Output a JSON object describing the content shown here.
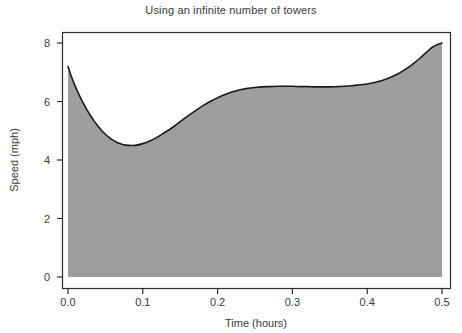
{
  "chart_data": {
    "type": "area",
    "title": "Using an infinite number of towers",
    "xlabel": "Time (hours)",
    "ylabel": "Speed (mph)",
    "xlim": [
      0.0,
      0.5
    ],
    "ylim": [
      0.0,
      8.6
    ],
    "xticks": [
      0.0,
      0.1,
      0.2,
      0.3,
      0.4,
      0.5
    ],
    "xtick_labels": [
      "0.0",
      "0.1",
      "0.2",
      "0.3",
      "0.4",
      "0.5"
    ],
    "yticks": [
      0,
      2,
      4,
      6,
      8
    ],
    "ytick_labels": [
      "0",
      "2",
      "4",
      "6",
      "8"
    ],
    "grid": false,
    "legend": "none",
    "series": [
      {
        "name": "Speed",
        "line_color": "#1a1a1a",
        "fill_color": "#9e9e9e",
        "baseline": 0,
        "x": [
          0.0,
          0.005,
          0.01,
          0.015,
          0.02,
          0.025,
          0.03,
          0.035,
          0.04,
          0.045,
          0.05,
          0.055,
          0.06,
          0.065,
          0.07,
          0.075,
          0.08,
          0.09,
          0.1,
          0.11,
          0.12,
          0.13,
          0.14,
          0.15,
          0.16,
          0.17,
          0.18,
          0.19,
          0.2,
          0.21,
          0.22,
          0.23,
          0.24,
          0.25,
          0.26,
          0.27,
          0.28,
          0.29,
          0.3,
          0.31,
          0.32,
          0.33,
          0.34,
          0.35,
          0.36,
          0.37,
          0.38,
          0.39,
          0.4,
          0.41,
          0.42,
          0.43,
          0.44,
          0.45,
          0.46,
          0.47,
          0.48,
          0.485,
          0.49,
          0.495,
          0.5
        ],
        "y": [
          7.2,
          6.82,
          6.5,
          6.22,
          5.96,
          5.73,
          5.52,
          5.33,
          5.16,
          5.01,
          4.88,
          4.77,
          4.68,
          4.61,
          4.56,
          4.52,
          4.5,
          4.5,
          4.56,
          4.66,
          4.79,
          4.95,
          5.12,
          5.31,
          5.5,
          5.68,
          5.85,
          6.0,
          6.13,
          6.24,
          6.33,
          6.4,
          6.45,
          6.48,
          6.5,
          6.51,
          6.52,
          6.52,
          6.52,
          6.51,
          6.51,
          6.5,
          6.5,
          6.5,
          6.51,
          6.52,
          6.54,
          6.57,
          6.6,
          6.65,
          6.72,
          6.81,
          6.93,
          7.08,
          7.26,
          7.47,
          7.7,
          7.82,
          7.9,
          7.96,
          8.0
        ]
      }
    ]
  },
  "figure": {
    "background_color": "#ffffff",
    "frame_color": "#2b2b2b"
  }
}
